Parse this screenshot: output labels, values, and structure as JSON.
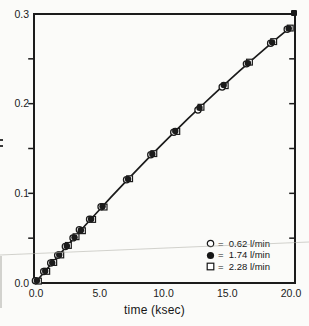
{
  "figure": {
    "background": "#fbfbf9",
    "ink": "#1b1b1b",
    "line_color": "#161616"
  },
  "chart_data": {
    "type": "scatter",
    "title": "",
    "xlabel": "time (ksec)",
    "ylabel": "",
    "xlim": [
      0,
      20
    ],
    "ylim": [
      0,
      0.3
    ],
    "grid": false,
    "legend_position": "bottom-right",
    "x_tick_values": [
      0,
      5,
      10,
      15,
      20
    ],
    "x_tick_labels": [
      "0.0",
      "5.0",
      "10.0",
      "15.0",
      "20.0"
    ],
    "y_tick_values": [
      0,
      0.1,
      0.2,
      0.3
    ],
    "y_tick_labels": [
      "0.0",
      "0.1",
      "0.2",
      "0.3"
    ],
    "y_minor_tick_values": [
      0.05,
      0.1,
      0.15,
      0.2,
      0.25
    ],
    "x": [
      0.15,
      0.8,
      1.35,
      1.9,
      2.5,
      3.1,
      3.6,
      4.4,
      5.3,
      7.3,
      9.2,
      11.0,
      12.9,
      14.8,
      16.7,
      18.6,
      19.9
    ],
    "series": [
      {
        "name": "0.62 l/min",
        "flow_rate": "0.62 l/min",
        "marker": "open-circle",
        "legend_label": "=  0.62 l/min",
        "x_offset": -0.12,
        "values": [
          0.0025,
          0.0128,
          0.0222,
          0.031,
          0.0406,
          0.0503,
          0.0595,
          0.071,
          0.0851,
          0.1151,
          0.1431,
          0.1682,
          0.193,
          0.2186,
          0.2444,
          0.2674,
          0.283
        ]
      },
      {
        "name": "1.74 l/min",
        "flow_rate": "1.74 l/min",
        "marker": "filled-circle",
        "legend_label": "=  1.74 l/min",
        "x_offset": 0,
        "values": [
          0.0027,
          0.0135,
          0.0225,
          0.0316,
          0.0413,
          0.0509,
          0.0588,
          0.0715,
          0.0856,
          0.1159,
          0.1438,
          0.1695,
          0.1955,
          0.2208,
          0.245,
          0.2684,
          0.2838
        ]
      },
      {
        "name": "2.28 l/min",
        "flow_rate": "2.28 l/min",
        "marker": "open-square",
        "legend_label": "=  2.28 l/min",
        "x_offset": 0.12,
        "values": [
          0.0021,
          0.013,
          0.0229,
          0.0313,
          0.0419,
          0.0516,
          0.0583,
          0.0709,
          0.0847,
          0.1163,
          0.1443,
          0.169,
          0.196,
          0.2201,
          0.2463,
          0.2692,
          0.2843
        ]
      }
    ],
    "fit_line": {
      "x": [
        0,
        1,
        2,
        3,
        4,
        5,
        6,
        7,
        8,
        9,
        10,
        11,
        12,
        13,
        14,
        15,
        16,
        17,
        18,
        19,
        20
      ],
      "y": [
        0,
        0.0167,
        0.0331,
        0.0492,
        0.0652,
        0.0808,
        0.0962,
        0.1113,
        0.1262,
        0.1408,
        0.1552,
        0.1693,
        0.1832,
        0.1968,
        0.2101,
        0.2232,
        0.236,
        0.2486,
        0.2609,
        0.273,
        0.2848
      ]
    }
  }
}
